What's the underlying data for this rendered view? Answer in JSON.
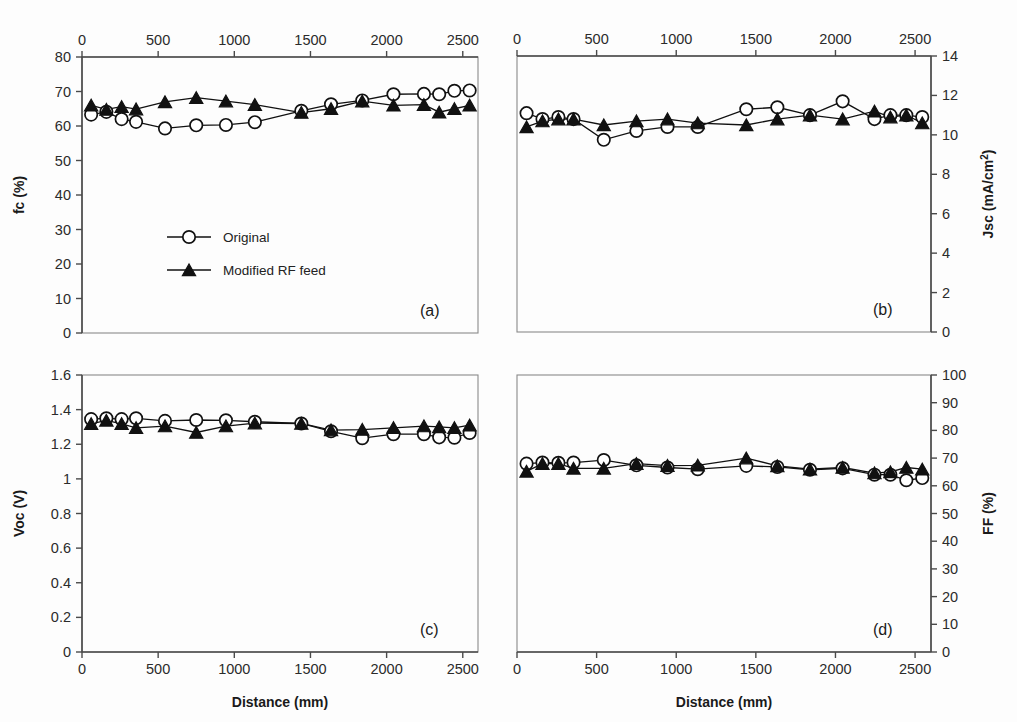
{
  "figure": {
    "width": 1017,
    "height": 722,
    "background": "#fdfdfd",
    "ink_color": "#111111",
    "axis_color": "#4a4a4a"
  },
  "legend": {
    "position": "inside panel (a), lower-left-center",
    "entries": [
      {
        "label": "Original",
        "marker": "open-circle"
      },
      {
        "label": "Modified RF feed",
        "marker": "filled-triangle"
      }
    ]
  },
  "shared": {
    "xlabel": "Distance (mm)",
    "xlim": [
      0,
      2600
    ],
    "xticks": [
      0,
      500,
      1000,
      1500,
      2000,
      2500
    ],
    "series_names": [
      "Original",
      "Modified RF feed"
    ]
  },
  "chart_data": [
    {
      "type": "line",
      "panel": "(a)",
      "title": "",
      "xlabel": "Distance (mm)",
      "ylabel": "fc (%)",
      "xlim": [
        0,
        2600
      ],
      "ylim": [
        0,
        80
      ],
      "xticks": [
        0,
        500,
        1000,
        1500,
        2000,
        2500
      ],
      "yticks": [
        0,
        10,
        20,
        30,
        40,
        50,
        60,
        70,
        80
      ],
      "xticklabels": [
        "0",
        "500",
        "1000",
        "1500",
        "2000",
        "2500"
      ],
      "yticklabels": [
        "0",
        "10",
        "20",
        "30",
        "40",
        "50",
        "60",
        "70",
        "80"
      ],
      "xaxis_position": "top",
      "yaxis_position": "left",
      "grid": false,
      "legend_shown": true,
      "x": [
        60,
        160,
        260,
        355,
        545,
        750,
        945,
        1135,
        1440,
        1635,
        1840,
        2045,
        2245,
        2345,
        2445,
        2545
      ],
      "series": [
        {
          "name": "Original",
          "marker": "open-circle",
          "values": [
            63.3,
            64.1,
            62.0,
            61.2,
            59.3,
            60.2,
            60.3,
            61.1,
            64.4,
            66.3,
            67.4,
            69.2,
            69.3,
            69.2,
            70.2,
            70.3
          ]
        },
        {
          "name": "Modified RF feed",
          "marker": "filled-triangle",
          "values": [
            66.0,
            64.8,
            65.6,
            64.9,
            67.0,
            68.2,
            67.2,
            66.2,
            63.9,
            65.0,
            67.2,
            66.0,
            66.2,
            64.0,
            65.0,
            66.0
          ]
        }
      ]
    },
    {
      "type": "line",
      "panel": "(b)",
      "title": "",
      "xlabel": "Distance (mm)",
      "ylabel": "Jsc (mA/cm2)",
      "ylabel_display": "Jsc (mA/cm²)",
      "xlim": [
        0,
        2600
      ],
      "ylim": [
        0,
        14
      ],
      "xticks": [
        0,
        500,
        1000,
        1500,
        2000,
        2500
      ],
      "yticks": [
        0,
        2,
        4,
        6,
        8,
        10,
        12,
        14
      ],
      "xticklabels": [
        "0",
        "500",
        "1000",
        "1500",
        "2000",
        "2500"
      ],
      "yticklabels": [
        "0",
        "2",
        "4",
        "6",
        "8",
        "10",
        "12",
        "14"
      ],
      "xaxis_position": "top",
      "yaxis_position": "right",
      "grid": false,
      "legend_shown": false,
      "x": [
        60,
        160,
        260,
        355,
        545,
        750,
        945,
        1135,
        1440,
        1635,
        1840,
        2045,
        2245,
        2345,
        2445,
        2545
      ],
      "series": [
        {
          "name": "Original",
          "marker": "open-circle",
          "values": [
            11.1,
            10.8,
            10.9,
            10.8,
            9.75,
            10.2,
            10.4,
            10.4,
            11.3,
            11.4,
            11.0,
            11.7,
            10.8,
            11.0,
            11.0,
            10.9
          ]
        },
        {
          "name": "Modified RF feed",
          "marker": "filled-triangle",
          "values": [
            10.4,
            10.7,
            10.8,
            10.8,
            10.5,
            10.7,
            10.8,
            10.6,
            10.5,
            10.8,
            11.0,
            10.8,
            11.2,
            10.9,
            11.0,
            10.6
          ]
        }
      ]
    },
    {
      "type": "line",
      "panel": "(c)",
      "title": "",
      "xlabel": "Distance (mm)",
      "ylabel": "Voc (V)",
      "xlim": [
        0,
        2600
      ],
      "ylim": [
        0,
        1.6
      ],
      "xticks": [
        0,
        500,
        1000,
        1500,
        2000,
        2500
      ],
      "yticks": [
        0,
        0.2,
        0.4,
        0.6,
        0.8,
        1,
        1.2,
        1.4,
        1.6
      ],
      "xticklabels": [
        "0",
        "500",
        "1000",
        "1500",
        "2000",
        "2500"
      ],
      "yticklabels": [
        "0",
        "0.2",
        "0.4",
        "0.6",
        "0.8",
        "1",
        "1.2",
        "1.4",
        "1.6"
      ],
      "xaxis_position": "bottom",
      "yaxis_position": "left",
      "grid": false,
      "legend_shown": false,
      "x": [
        60,
        160,
        260,
        355,
        545,
        750,
        945,
        1135,
        1440,
        1635,
        1840,
        2045,
        2245,
        2345,
        2445,
        2545
      ],
      "series": [
        {
          "name": "Original",
          "marker": "open-circle",
          "values": [
            1.345,
            1.35,
            1.345,
            1.35,
            1.335,
            1.34,
            1.338,
            1.33,
            1.32,
            1.275,
            1.235,
            1.258,
            1.258,
            1.24,
            1.238,
            1.265
          ]
        },
        {
          "name": "Modified RF feed",
          "marker": "filled-triangle",
          "values": [
            1.318,
            1.338,
            1.318,
            1.295,
            1.305,
            1.268,
            1.305,
            1.322,
            1.32,
            1.282,
            1.285,
            1.295,
            1.305,
            1.3,
            1.295,
            1.31
          ]
        }
      ]
    },
    {
      "type": "line",
      "panel": "(d)",
      "title": "",
      "xlabel": "Distance (mm)",
      "ylabel": "FF (%)",
      "xlim": [
        0,
        2600
      ],
      "ylim": [
        0,
        100
      ],
      "xticks": [
        0,
        500,
        1000,
        1500,
        2000,
        2500
      ],
      "yticks": [
        0,
        10,
        20,
        30,
        40,
        50,
        60,
        70,
        80,
        90,
        100
      ],
      "xticklabels": [
        "0",
        "500",
        "1000",
        "1500",
        "2000",
        "2500"
      ],
      "yticklabels": [
        "0",
        "10",
        "20",
        "30",
        "40",
        "50",
        "60",
        "70",
        "80",
        "90",
        "100"
      ],
      "xaxis_position": "bottom",
      "yaxis_position": "right",
      "grid": false,
      "legend_shown": false,
      "x": [
        60,
        160,
        260,
        355,
        545,
        750,
        945,
        1135,
        1440,
        1635,
        1840,
        2045,
        2245,
        2345,
        2445,
        2545
      ],
      "series": [
        {
          "name": "Original",
          "marker": "open-circle",
          "values": [
            68.0,
            68.4,
            68.3,
            68.4,
            69.3,
            67.4,
            66.6,
            66.0,
            67.2,
            66.8,
            65.8,
            66.3,
            64.0,
            64.0,
            62.0,
            62.8
          ]
        },
        {
          "name": "Modified RF feed",
          "marker": "filled-triangle",
          "values": [
            65.2,
            68.0,
            68.0,
            66.3,
            66.3,
            68.0,
            67.3,
            67.4,
            70.0,
            67.2,
            66.0,
            66.6,
            64.6,
            65.0,
            66.6,
            66.0
          ]
        }
      ]
    }
  ]
}
